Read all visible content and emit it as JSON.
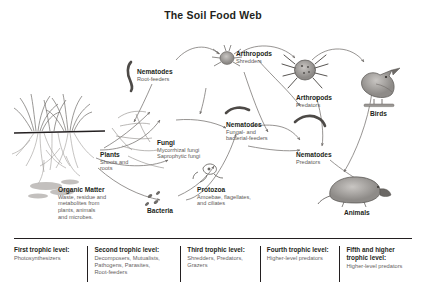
{
  "title": "The Soil Food Web",
  "colors": {
    "ink": "#231f20",
    "subtext": "#5d5a57",
    "arrow": "#6e6a67",
    "organism_fill": "#9a9794",
    "background": "#ffffff"
  },
  "nodes": [
    {
      "id": "plants",
      "heading": "Plants",
      "sub": "Shoots and\nroots",
      "icon": "grass-plant-illustration"
    },
    {
      "id": "organic-matter",
      "heading": "Organic Matter",
      "sub": "Waste, residue and\nmetabolites from\nplants, animals\nand microbes.",
      "icon": "organic-matter-illustration"
    },
    {
      "id": "nematodes-root",
      "heading": "Nematodes",
      "sub": "Root-feeders",
      "icon": "nematode-worm-icon"
    },
    {
      "id": "fungi",
      "heading": "Fungi",
      "sub": "Mycorrhizal fungi\nSaprophytic fungi",
      "icon": "fungi-hyphae-icon"
    },
    {
      "id": "bacteria",
      "heading": "Bacteria",
      "sub": "",
      "icon": "bacteria-rods-icon"
    },
    {
      "id": "arthropods-shredders",
      "heading": "Arthropods",
      "sub": "Shredders",
      "icon": "arthropod-mite-icon"
    },
    {
      "id": "nematodes-fungal",
      "heading": "Nematodes",
      "sub": "Fungal- and\nbacterial-feeders",
      "icon": "nematode-worm-icon"
    },
    {
      "id": "protozoa",
      "heading": "Protozoa",
      "sub": "Amoebae, flagellates,\nand ciliates",
      "icon": "protozoa-amoeba-icon"
    },
    {
      "id": "arthropods-predators",
      "heading": "Arthropods",
      "sub": "Predators",
      "icon": "arthropod-spider-icon"
    },
    {
      "id": "nematodes-predators",
      "heading": "Nematodes",
      "sub": "Predators",
      "icon": "nematode-worm-icon"
    },
    {
      "id": "birds",
      "heading": "Birds",
      "sub": "",
      "icon": "bird-illustration"
    },
    {
      "id": "animals",
      "heading": "Animals",
      "sub": "",
      "icon": "mole-illustration"
    }
  ],
  "trophic_levels": [
    {
      "title": "First trophic level:",
      "desc": "Photosynthesizers"
    },
    {
      "title": "Second trophic level:",
      "desc": "Decomposers, Mutualists,\nPathogens, Parasites,\nRoot-feeders"
    },
    {
      "title": "Third trophic level:",
      "desc": "Shredders, Predators,\nGrazers"
    },
    {
      "title": "Fourth trophic level:",
      "desc": "Higher-level predators"
    },
    {
      "title": "Fifth and higher\ntrophic level:",
      "desc": "Higher-level predators"
    }
  ]
}
